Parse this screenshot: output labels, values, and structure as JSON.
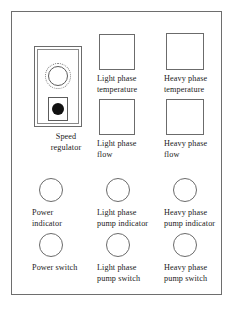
{
  "diagram": {
    "frame": {
      "style": "rectangular enclosure outline"
    },
    "colors": {
      "background": "#ffffff",
      "outline": "#6b6b6b",
      "frame_outline": "#6e6e6e",
      "text": "#1b1b1b",
      "lamp_fill": "#111111"
    }
  },
  "controls": {
    "speed_regulator": {
      "label": "Speed\nregulator",
      "dial_icon": "rotary-dial-icon",
      "lamp_icon": "indicator-lamp-icon",
      "type": "module"
    },
    "displays": [
      {
        "label": "Light phase\ntemperature",
        "name": "light-phase-temperature",
        "type": "display"
      },
      {
        "label": "Heavy phase\ntemperature",
        "name": "heavy-phase-temperature",
        "type": "display"
      },
      {
        "label": "Light phase\nflow",
        "name": "light-phase-flow",
        "type": "display"
      },
      {
        "label": "Heavy phase\nflow",
        "name": "heavy-phase-flow",
        "type": "display"
      }
    ],
    "indicators": [
      {
        "label": "Power\nindicator",
        "name": "power-indicator",
        "type": "indicator"
      },
      {
        "label": "Light phase\npump indicator",
        "name": "light-phase-pump-indicator",
        "type": "indicator"
      },
      {
        "label": "Heavy phase\npump indicator",
        "name": "heavy-phase-pump-indicator",
        "type": "indicator"
      }
    ],
    "switches": [
      {
        "label": "Power switch",
        "name": "power-switch",
        "type": "switch"
      },
      {
        "label": "Light phase\npump switch",
        "name": "light-phase-pump-switch",
        "type": "switch"
      },
      {
        "label": "Heavy phase\npump switch",
        "name": "heavy-phase-pump-switch",
        "type": "switch"
      }
    ]
  }
}
